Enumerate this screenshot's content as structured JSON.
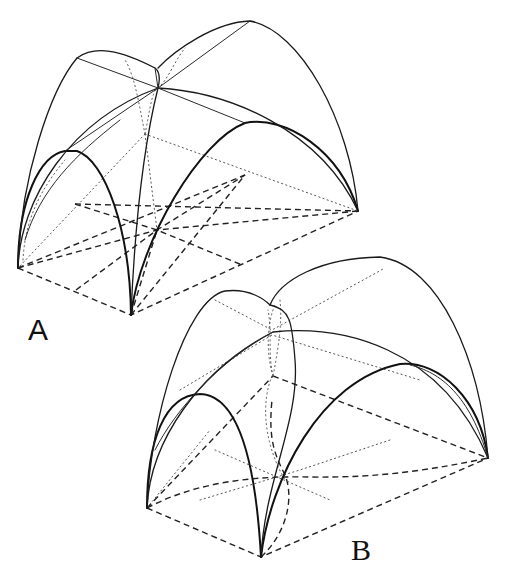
{
  "figure": {
    "labels": {
      "a": "A",
      "b": "B"
    },
    "line_styles": {
      "solid": "visible arches and ribs",
      "dashed": "plan lines on the ground",
      "dotted": "hidden/construction lines"
    },
    "colors": {
      "background": "#ffffff",
      "ink": "#111111"
    }
  }
}
